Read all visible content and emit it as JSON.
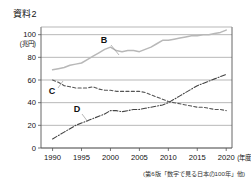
{
  "title": "資料2",
  "caption": "(第6版「数字で見る日本の100年」他)",
  "axis": {
    "y_unit": "(兆円)",
    "x_unit": "(年度)",
    "y_ticks": [
      "100",
      "80",
      "60",
      "40",
      "20",
      "0"
    ],
    "x_ticks": [
      "1990",
      "1995",
      "2000",
      "2005",
      "2010",
      "2015",
      "2020"
    ]
  },
  "series_labels": {
    "b": "B",
    "c": "C",
    "d": "D"
  },
  "chart_data": {
    "type": "line",
    "title": "資料2",
    "xlabel": "(年度)",
    "ylabel": "(兆円)",
    "xlim": [
      1988,
      2021
    ],
    "ylim": [
      0,
      105
    ],
    "grid": true,
    "legend": "inline-labels",
    "x": [
      1990,
      1991,
      1992,
      1993,
      1994,
      1995,
      1996,
      1997,
      1998,
      1999,
      2000,
      2001,
      2002,
      2003,
      2004,
      2005,
      2006,
      2007,
      2008,
      2009,
      2010,
      2011,
      2012,
      2013,
      2014,
      2015,
      2016,
      2017,
      2018,
      2019,
      2020
    ],
    "series": [
      {
        "name": "B",
        "style": "solid",
        "color": "#b8b8b8",
        "values": [
          69,
          70,
          71,
          73,
          74,
          75,
          78,
          81,
          84,
          87,
          89,
          86,
          85,
          86,
          86,
          85,
          87,
          89,
          92,
          95,
          95,
          96,
          97,
          98,
          99,
          99,
          100,
          100,
          101,
          102,
          104
        ]
      },
      {
        "name": "C",
        "style": "dashed",
        "color": "#555555",
        "values": [
          60,
          58,
          55,
          54,
          53,
          53,
          53,
          54,
          52,
          51,
          51,
          50,
          50,
          50,
          50,
          50,
          49,
          47,
          45,
          43,
          41,
          40,
          39,
          38,
          37,
          36,
          36,
          35,
          34,
          34,
          33
        ]
      },
      {
        "name": "D",
        "style": "dashdot",
        "color": "#444444",
        "values": [
          8,
          11,
          14,
          17,
          20,
          22,
          24,
          26,
          28,
          30,
          33,
          33,
          32,
          33,
          34,
          34,
          35,
          36,
          37,
          38,
          40,
          43,
          46,
          49,
          52,
          55,
          57,
          59,
          61,
          63,
          65
        ]
      }
    ]
  }
}
